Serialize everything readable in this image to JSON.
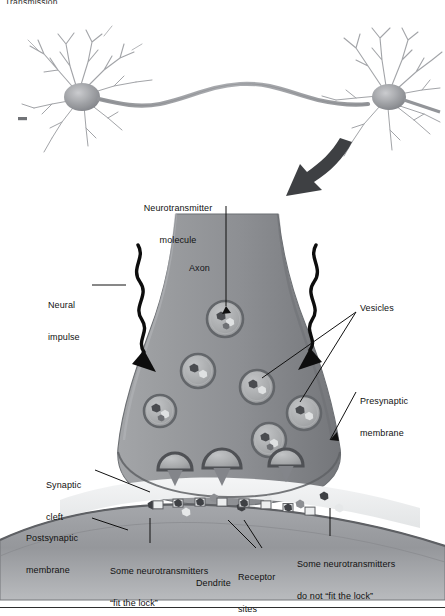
{
  "page": {
    "header_text": "Transmission",
    "background_color": "#ffffff",
    "width": 445,
    "height": 616
  },
  "figure": {
    "palette": {
      "terminal_fill": "#8e9093",
      "terminal_edge": "#6f7276",
      "vesicle_fill": "#a9abad",
      "vesicle_ring": "#6b6e71",
      "dendrite_fill": "#9a9ca0",
      "cleft_fill": "#eceeef",
      "arrow_dark": "#3a3c3f",
      "neuron_body": "#8c8e92",
      "label_text": "#111111"
    }
  },
  "top_illustration": {
    "name": "two-connected-neurons",
    "left_neuron_label": "",
    "right_neuron_label": "",
    "description": "Two multipolar neurons joined by a long axon"
  },
  "pointer_arrow": {
    "name": "zoom-in-arrow",
    "direction": "down-left"
  },
  "labels": [
    {
      "id": "neurotransmitter_molecule",
      "text": "Neurotransmitter\nmolecule",
      "x": 182,
      "y": 184,
      "align": "center"
    },
    {
      "id": "neural_impulse",
      "text": "Neural\nimpulse",
      "x": 52,
      "y": 281,
      "align": "left"
    },
    {
      "id": "axon",
      "text": "Axon",
      "x": 189,
      "y": 265,
      "align": "left"
    },
    {
      "id": "vesicles",
      "text": "Vesicles",
      "x": 358,
      "y": 307,
      "align": "left"
    },
    {
      "id": "presynaptic_membrane",
      "text": "Presynaptic\nmembrane",
      "x": 358,
      "y": 378,
      "align": "left"
    },
    {
      "id": "synaptic_cleft",
      "text": "Synaptic\ncleft",
      "x": 48,
      "y": 461,
      "align": "left"
    },
    {
      "id": "postsynaptic_membrane",
      "text": "Postsynaptic\nmembrane",
      "x": 28,
      "y": 514,
      "align": "left"
    },
    {
      "id": "fit_the_lock",
      "text": "Some neurotransmitters\n“fit the lock”",
      "x": 110,
      "y": 545,
      "align": "left"
    },
    {
      "id": "receptor_sites",
      "text": "Receptor\nsites",
      "x": 238,
      "y": 551,
      "align": "left"
    },
    {
      "id": "do_not_fit_the_lock",
      "text": "Some neurotransmitters\ndo not “fit the lock”",
      "x": 297,
      "y": 538,
      "align": "left"
    },
    {
      "id": "dendrite",
      "text": "Dendrite",
      "x": 198,
      "y": 578,
      "align": "left"
    }
  ],
  "label_text": {
    "neurotransmitter_molecule_l1": "Neurotransmitter",
    "neurotransmitter_molecule_l2": "molecule",
    "neural_impulse_l1": "Neural",
    "neural_impulse_l2": "impulse",
    "axon": "Axon",
    "vesicles": "Vesicles",
    "presynaptic_l1": "Presynaptic",
    "presynaptic_l2": "membrane",
    "synaptic_cleft_l1": "Synaptic",
    "synaptic_cleft_l2": "cleft",
    "postsynaptic_l1": "Postsynaptic",
    "postsynaptic_l2": "membrane",
    "fit_lock_l1": "Some neurotransmitters",
    "fit_lock_l2": "“fit the lock”",
    "receptor_l1": "Receptor",
    "receptor_l2": "sites",
    "not_fit_l1": "Some neurotransmitters",
    "not_fit_l2": "do not “fit the lock”",
    "dendrite": "Dendrite"
  },
  "vesicles": [
    {
      "cx": 225,
      "cy": 319,
      "r": 18,
      "state": "intact"
    },
    {
      "cx": 198,
      "cy": 371,
      "r": 17,
      "state": "intact"
    },
    {
      "cx": 160,
      "cy": 411,
      "r": 16,
      "state": "intact"
    },
    {
      "cx": 257,
      "cy": 387,
      "r": 17,
      "state": "intact"
    },
    {
      "cx": 269,
      "cy": 440,
      "r": 17,
      "state": "intact"
    },
    {
      "cx": 304,
      "cy": 413,
      "r": 17,
      "state": "intact"
    },
    {
      "cx": 175,
      "cy": 470,
      "r": 17,
      "state": "fusing"
    },
    {
      "cx": 222,
      "cy": 468,
      "r": 19,
      "state": "fusing"
    },
    {
      "cx": 286,
      "cy": 466,
      "r": 17,
      "state": "fusing"
    }
  ],
  "free_neurotransmitters": [
    {
      "x": 152,
      "y": 505
    },
    {
      "x": 186,
      "y": 512
    },
    {
      "x": 214,
      "y": 498
    },
    {
      "x": 241,
      "y": 507
    },
    {
      "x": 268,
      "y": 500
    },
    {
      "x": 300,
      "y": 504
    },
    {
      "x": 324,
      "y": 496
    },
    {
      "x": 339,
      "y": 508
    }
  ],
  "receptor_sites": [
    {
      "x": 158,
      "filled": false
    },
    {
      "x": 178,
      "filled": true
    },
    {
      "x": 200,
      "filled": true
    },
    {
      "x": 222,
      "filled": false
    },
    {
      "x": 244,
      "filled": true
    },
    {
      "x": 266,
      "filled": false
    },
    {
      "x": 288,
      "filled": true
    },
    {
      "x": 310,
      "filled": false
    }
  ]
}
